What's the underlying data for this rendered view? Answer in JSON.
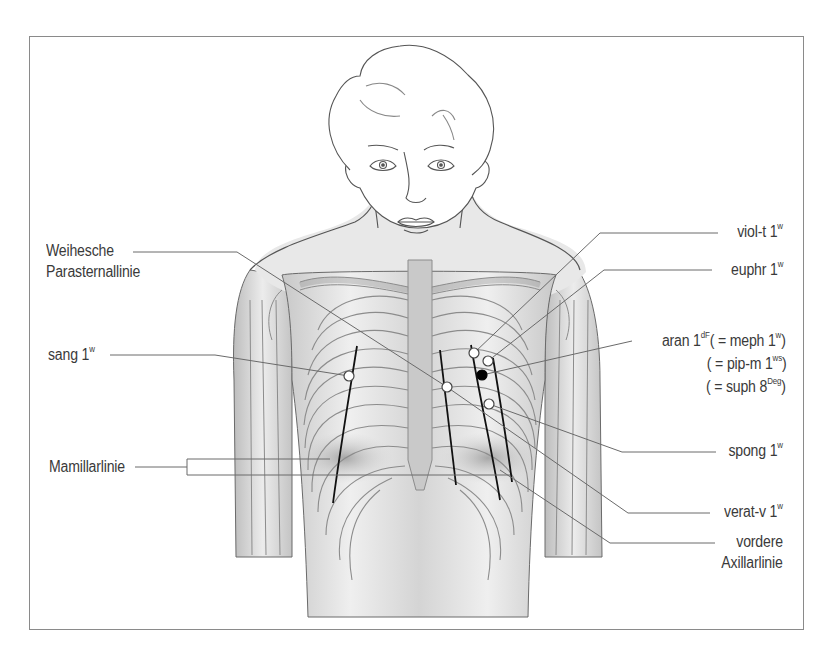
{
  "figure": {
    "colors": {
      "outline": "#555555",
      "skin_shade": "#d9d9d9",
      "rib_line": "#8c8c8c",
      "guide_line": "#111111",
      "leader_line": "#6a6a6a",
      "point_open": "#ffffff",
      "point_filled": "#000000",
      "frame": "#8a8a8a"
    }
  },
  "labels_left": {
    "weihesche_line1": "Weihesche",
    "weihesche_line2": "Parasternallinie",
    "sang": "sang 1",
    "sang_sup": "w",
    "mamillarlinie": "Mamillarlinie"
  },
  "labels_right": {
    "viol_t": "viol-t 1",
    "viol_t_sup": "w",
    "euphr": "euphr 1",
    "euphr_sup": "w",
    "aran": "aran 1",
    "aran_sup": "dF",
    "aran_eq_meph": "( = meph 1",
    "aran_eq_meph_sup": "w",
    "aran_eq_meph_close": ")",
    "pip_m": "( = pip-m 1",
    "pip_m_sup": "ws",
    "pip_m_close": ")",
    "suph": "( = suph 8",
    "suph_sup": "Deg",
    "suph_close": ")",
    "spong": "spong 1",
    "spong_sup": "w",
    "verat_v": "verat-v 1",
    "verat_v_sup": "w",
    "vordere_line1": "vordere",
    "vordere_line2": "Axillarlinie"
  },
  "points": [
    {
      "name": "sang",
      "x": 349,
      "y": 376,
      "type": "open"
    },
    {
      "name": "verat-v",
      "x": 447,
      "y": 387,
      "type": "open"
    },
    {
      "name": "viol-t",
      "x": 474,
      "y": 353,
      "type": "open"
    },
    {
      "name": "euphr",
      "x": 488,
      "y": 361,
      "type": "open"
    },
    {
      "name": "aran",
      "x": 482,
      "y": 375,
      "type": "filled"
    },
    {
      "name": "spong",
      "x": 489,
      "y": 404,
      "type": "open"
    }
  ]
}
